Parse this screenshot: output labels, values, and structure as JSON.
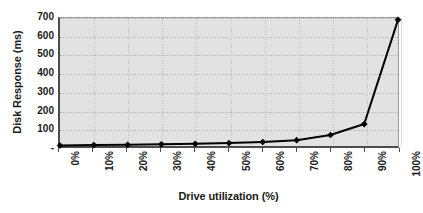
{
  "chart_data": {
    "type": "line",
    "title": "",
    "xlabel": "Drive utilization (%)",
    "ylabel": "Disk Response (ms)",
    "categories": [
      "0%",
      "10%",
      "20%",
      "30%",
      "40%",
      "50%",
      "60%",
      "70%",
      "80%",
      "90%",
      "100%"
    ],
    "x_values": [
      0,
      10,
      20,
      30,
      40,
      50,
      60,
      70,
      80,
      90,
      100
    ],
    "values": [
      3,
      5,
      7,
      9,
      12,
      16,
      22,
      32,
      60,
      120,
      690
    ],
    "series": [
      {
        "name": "Disk Response",
        "values": [
          3,
          5,
          7,
          9,
          12,
          16,
          22,
          32,
          60,
          120,
          690
        ],
        "marker": "diamond",
        "line_color": "#000000",
        "marker_color": "#000000"
      }
    ],
    "ylim": [
      0,
      700
    ],
    "xlim": [
      0,
      100
    ],
    "y_ticks": [
      0,
      100,
      200,
      300,
      400,
      500,
      600,
      700
    ],
    "y_tick_labels": [
      "-",
      "100",
      "200",
      "300",
      "400",
      "500",
      "600",
      "700"
    ],
    "grid": true,
    "grid_style": "dotted",
    "legend": "none",
    "plot_background": "#e2e2e2",
    "figure_background": "#ffffff",
    "axis_color": "#4d4d4d"
  },
  "axes": {
    "y_title": "Disk Response (ms)",
    "x_title": "Drive utilization (%)"
  }
}
